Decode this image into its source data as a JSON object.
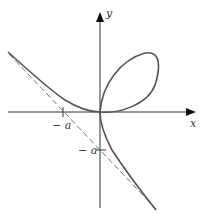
{
  "figure": {
    "title_fragment": "",
    "curve": "folium-of-descartes",
    "equation_hint": "x^3 + y^3 = 3axy",
    "axes": {
      "x_label": "x",
      "y_label": "y"
    },
    "ticks": {
      "x_neg_a": "− a",
      "y_neg_a": "− a"
    },
    "asymptote": "x + y + a = 0",
    "colors": {
      "curve": "#555555",
      "axis": "#333333",
      "asymptote": "#777777"
    }
  }
}
